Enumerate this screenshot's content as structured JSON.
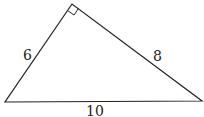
{
  "diagram": {
    "type": "right-triangle",
    "vertices": {
      "right_angle": [
        72,
        4
      ],
      "bottom_left": [
        5,
        102
      ],
      "bottom_right": [
        202,
        101
      ]
    },
    "sides": [
      {
        "id": "left",
        "label": "6"
      },
      {
        "id": "right",
        "label": "8"
      },
      {
        "id": "bottom",
        "label": "10"
      }
    ],
    "right_angle_marker": true,
    "stroke_color": "#222222"
  }
}
